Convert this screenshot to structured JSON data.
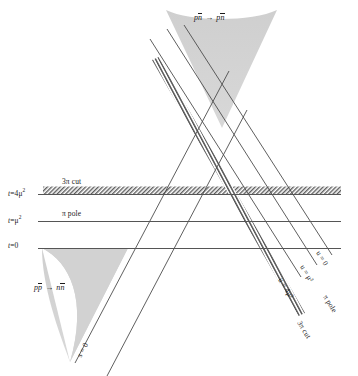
{
  "figure": {
    "type": "mandelstam-diagram",
    "background_color": "#ffffff",
    "line_color": "#5a5a5a",
    "hatch_color": "#6b6b6b",
    "region_fill": "#d4d4d4",
    "text_color": "#1a1a1a",
    "canvas": {
      "width": 358,
      "height": 376
    }
  },
  "axis_labels": [
    {
      "id": "t-4mu2",
      "text": "t = 4μ²",
      "parts": {
        "var": "t",
        "eq": "=",
        "value": "4μ",
        "exp": "2"
      },
      "x": 8,
      "y": 186
    },
    {
      "id": "t-mu2",
      "text": "t = μ²",
      "parts": {
        "var": "t",
        "eq": "=",
        "value": "μ",
        "exp": "2"
      },
      "x": 8,
      "y": 213
    },
    {
      "id": "t-0",
      "text": "t = 0",
      "parts": {
        "var": "t",
        "eq": "=",
        "value": "0",
        "exp": ""
      },
      "x": 8,
      "y": 240
    }
  ],
  "line_labels": [
    {
      "id": "3pi-cut-top",
      "text": "3π cut",
      "x": 62,
      "y": 178,
      "rotation": 0
    },
    {
      "id": "pi-pole-left",
      "text": "π pole",
      "x": 62,
      "y": 208,
      "rotation": 0
    },
    {
      "id": "s-0",
      "text": "s = 0",
      "x": 78,
      "y": 350,
      "rotation": -62
    },
    {
      "id": "u-0",
      "text": "u = 0",
      "x": 316,
      "y": 248,
      "rotation": 62
    },
    {
      "id": "u-mu2",
      "text": "u = μ²",
      "x": 300,
      "y": 262,
      "rotation": 62
    },
    {
      "id": "u-4mu2",
      "text": "u = 4μ²",
      "x": 278,
      "y": 275,
      "rotation": 62
    },
    {
      "id": "pi-pole-right",
      "text": "π pole",
      "x": 322,
      "y": 292,
      "rotation": 62
    },
    {
      "id": "3pi-cut-right",
      "text": "3π cut",
      "x": 296,
      "y": 318,
      "rotation": 62
    }
  ],
  "region_labels": [
    {
      "id": "top-region",
      "reaction": "p n̄ → p n̄",
      "left": "p",
      "left_bar": "n",
      "right": "p",
      "right_bar": "n",
      "arrow": "→",
      "x": 199,
      "y": 16
    },
    {
      "id": "bottom-region",
      "reaction": "p p̄ → n n̄",
      "left": "p",
      "left_bar": "p",
      "right": "n",
      "right_bar": "n",
      "arrow": "→",
      "x": 38,
      "y": 286
    }
  ],
  "geometry": {
    "horizontal_lines": [
      {
        "id": "t-4mu2-line",
        "y": 194,
        "x1": 38,
        "x2": 341
      },
      {
        "id": "t-mu2-line",
        "y": 221,
        "x1": 38,
        "x2": 341
      },
      {
        "id": "t-0-line",
        "y": 248,
        "x1": 38,
        "x2": 341
      }
    ],
    "hatched_horizontal_band": {
      "id": "3pi-cut-band",
      "y_top": 186,
      "y_bottom": 194,
      "x1": 43,
      "x2": 341
    },
    "s_lines": [
      {
        "id": "s-0-line",
        "x1": 75,
        "y1": 363,
        "x2": 228,
        "y2": 73
      },
      {
        "id": "s-mu2-line",
        "x1": 104,
        "y1": 376,
        "x2": 246,
        "y2": 106
      }
    ],
    "u_lines": [
      {
        "id": "u-0-line",
        "x1": 184,
        "y1": 27,
        "x2": 331,
        "y2": 256
      },
      {
        "id": "u-mu2-line",
        "x1": 167,
        "y1": 30,
        "x2": 316,
        "y2": 266
      },
      {
        "id": "u-4mu2-line",
        "x1": 150,
        "y1": 40,
        "x2": 300,
        "y2": 278
      }
    ],
    "hatched_diagonal_band": {
      "id": "3pi-cut-u-band",
      "x1": 152,
      "y1": 60,
      "x2": 298,
      "y2": 315
    },
    "top_cone": {
      "id": "pnbar-region",
      "apex_x": 222,
      "apex_y": 128,
      "left_x": 166,
      "top_y": 10,
      "right_x": 277
    },
    "bottom_cone": {
      "id": "ppbar-region",
      "apex_x": 70,
      "apex_y": 362,
      "top_y": 248,
      "left_x": 42,
      "right_x": 128
    }
  }
}
